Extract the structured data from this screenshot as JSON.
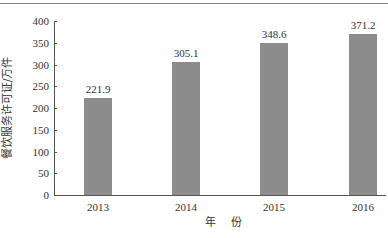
{
  "chart_data": {
    "type": "bar",
    "title": "",
    "xlabel": "年 份",
    "ylabel": "餐饮服务许可证/万件",
    "categories": [
      "2013",
      "2014",
      "2015",
      "2016"
    ],
    "values": [
      221.9,
      305.1,
      348.6,
      371.2
    ],
    "value_labels": [
      "221.9",
      "305.1",
      "348.6",
      "371.2"
    ],
    "ylim": [
      0,
      400
    ],
    "yticks": [
      0,
      50,
      100,
      150,
      200,
      250,
      300,
      350,
      400
    ],
    "ytick_labels": [
      "0",
      "50",
      "100",
      "150",
      "200",
      "250",
      "300",
      "350",
      "400"
    ],
    "grid": false,
    "legend": null,
    "bar_color": "#8c8c8c"
  }
}
